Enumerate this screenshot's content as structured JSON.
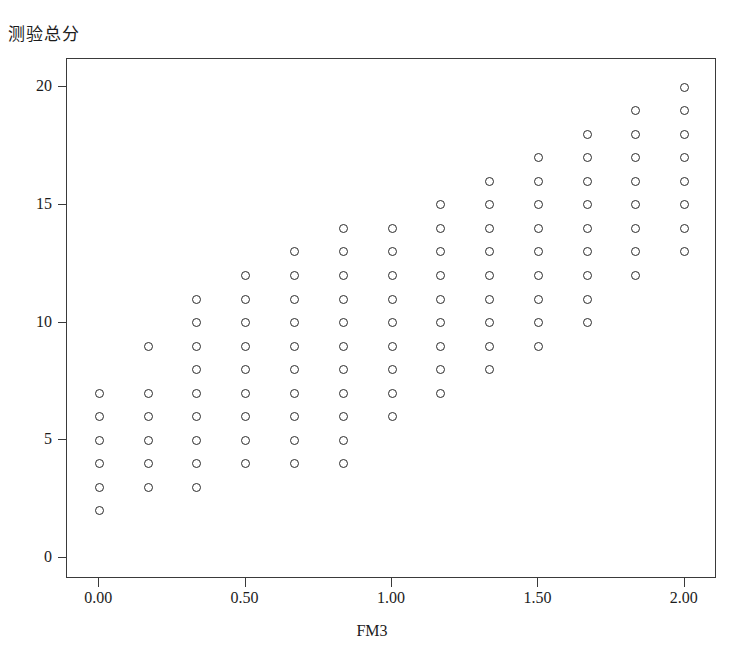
{
  "chart_data": {
    "type": "scatter",
    "title": "",
    "ylabel": "测验总分",
    "xlabel": "FM3",
    "xlim": [
      -0.11,
      2.11
    ],
    "ylim": [
      -0.9,
      21.2
    ],
    "xticks": [
      0,
      0.5,
      1,
      1.5,
      2
    ],
    "xtick_labels": [
      "0.00",
      "0.50",
      "1.00",
      "1.50",
      "2.00"
    ],
    "yticks": [
      0,
      5,
      10,
      15,
      20
    ],
    "ytick_labels": [
      "0",
      "5",
      "10",
      "15",
      "20"
    ],
    "grid": false,
    "legend": null,
    "marker": "open-circle",
    "marker_color": "#2b2b2b",
    "columns": [
      {
        "x": 0.0,
        "x_label": "0.00",
        "y_values": [
          2,
          3,
          4,
          5,
          6,
          7
        ]
      },
      {
        "x": 0.167,
        "x_label": "0.17",
        "y_values": [
          3,
          4,
          5,
          6,
          7,
          9
        ]
      },
      {
        "x": 0.333,
        "x_label": "0.33",
        "y_values": [
          3,
          4,
          5,
          6,
          7,
          8,
          9,
          10,
          11
        ]
      },
      {
        "x": 0.5,
        "x_label": "0.50",
        "y_values": [
          4,
          5,
          6,
          7,
          8,
          9,
          10,
          11,
          12
        ]
      },
      {
        "x": 0.667,
        "x_label": "0.67",
        "y_values": [
          4,
          5,
          6,
          7,
          8,
          9,
          10,
          11,
          12,
          13
        ]
      },
      {
        "x": 0.833,
        "x_label": "0.83",
        "y_values": [
          4,
          5,
          6,
          7,
          8,
          9,
          10,
          11,
          12,
          13,
          14
        ]
      },
      {
        "x": 1.0,
        "x_label": "1.00",
        "y_values": [
          6,
          7,
          8,
          9,
          10,
          11,
          12,
          13,
          14
        ]
      },
      {
        "x": 1.167,
        "x_label": "1.17",
        "y_values": [
          7,
          8,
          9,
          10,
          11,
          12,
          13,
          14,
          15
        ]
      },
      {
        "x": 1.333,
        "x_label": "1.33",
        "y_values": [
          8,
          9,
          10,
          11,
          12,
          13,
          14,
          15,
          16
        ]
      },
      {
        "x": 1.5,
        "x_label": "1.50",
        "y_values": [
          9,
          10,
          11,
          12,
          13,
          14,
          15,
          16,
          17
        ]
      },
      {
        "x": 1.667,
        "x_label": "1.67",
        "y_values": [
          10,
          11,
          12,
          13,
          14,
          15,
          16,
          17,
          18
        ]
      },
      {
        "x": 1.833,
        "x_label": "1.83",
        "y_values": [
          12,
          13,
          14,
          15,
          16,
          17,
          18,
          19
        ]
      },
      {
        "x": 2.0,
        "x_label": "2.00",
        "y_values": [
          13,
          14,
          15,
          16,
          17,
          18,
          19,
          20
        ]
      }
    ]
  }
}
